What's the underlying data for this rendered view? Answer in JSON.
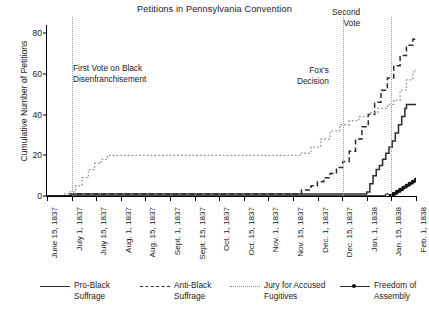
{
  "chart_data": {
    "type": "line",
    "title": "Petitions in Pennsylvania Convention",
    "xlabel": "",
    "ylabel": "Cumulative Number of Petitions",
    "ylim": [
      0,
      84
    ],
    "yticks": [
      0,
      20,
      40,
      60,
      80
    ],
    "grid": false,
    "legend_position": "bottom",
    "x_categories": [
      "June 15, 1837",
      "July 1, 1837",
      "July 15, 1837",
      "Aug. 1, 1837",
      "Aug. 15, 1837",
      "Sept. 1, 1837",
      "Sept. 15, 1837",
      "Oct. 1, 1837",
      "Oct. 15, 1837",
      "Nov. 1, 1837",
      "Nov. 15, 1837",
      "Dec. 1, 1837",
      "Dec. 15, 1837",
      "Jan. 1, 1838",
      "Jan. 15, 1838",
      "Feb. 1, 1838"
    ],
    "x_range_days": [
      0,
      232
    ],
    "annotations": [
      {
        "label": "First Vote on Black\nDisenfranchisement",
        "x_day": 16,
        "kind": "vertical-line"
      },
      {
        "label": "Fox's\nDecision",
        "x_day": 186,
        "kind": "vertical-line"
      },
      {
        "label": "Second\nVote",
        "x_day": 216,
        "kind": "vertical-line"
      }
    ],
    "series": [
      {
        "name": "Pro-Black Suffrage",
        "style": "solid",
        "color": "#2b2b2b",
        "final_value": 45,
        "points": [
          [
            0,
            0
          ],
          [
            14,
            0
          ],
          [
            16,
            1
          ],
          [
            40,
            1
          ],
          [
            180,
            1
          ],
          [
            196,
            1
          ],
          [
            200,
            1
          ],
          [
            201,
            2
          ],
          [
            203,
            6
          ],
          [
            205,
            10
          ],
          [
            207,
            13
          ],
          [
            209,
            15
          ],
          [
            211,
            18
          ],
          [
            213,
            21
          ],
          [
            215,
            24
          ],
          [
            217,
            27
          ],
          [
            219,
            31
          ],
          [
            221,
            35
          ],
          [
            223,
            39
          ],
          [
            225,
            43
          ],
          [
            226,
            45
          ],
          [
            232,
            45
          ]
        ]
      },
      {
        "name": "Anti-Black Suffrage",
        "style": "dashed",
        "color": "#2b2b2b",
        "final_value": 77,
        "points": [
          [
            0,
            0
          ],
          [
            14,
            1
          ],
          [
            16,
            1
          ],
          [
            150,
            1
          ],
          [
            160,
            3
          ],
          [
            166,
            5
          ],
          [
            170,
            7
          ],
          [
            174,
            9
          ],
          [
            178,
            11
          ],
          [
            182,
            14
          ],
          [
            186,
            17
          ],
          [
            190,
            22
          ],
          [
            194,
            28
          ],
          [
            198,
            34
          ],
          [
            202,
            40
          ],
          [
            206,
            46
          ],
          [
            210,
            52
          ],
          [
            214,
            58
          ],
          [
            218,
            64
          ],
          [
            222,
            69
          ],
          [
            226,
            74
          ],
          [
            230,
            77
          ],
          [
            232,
            77
          ]
        ]
      },
      {
        "name": "Jury for Accused Fugitives",
        "style": "dotted",
        "color": "#8c8c8c",
        "final_value": 62,
        "points": [
          [
            0,
            0
          ],
          [
            10,
            1
          ],
          [
            14,
            2
          ],
          [
            18,
            5
          ],
          [
            22,
            9
          ],
          [
            26,
            13
          ],
          [
            30,
            16
          ],
          [
            34,
            18
          ],
          [
            38,
            20
          ],
          [
            44,
            20
          ],
          [
            100,
            20
          ],
          [
            150,
            20
          ],
          [
            160,
            21
          ],
          [
            166,
            24
          ],
          [
            172,
            28
          ],
          [
            178,
            32
          ],
          [
            184,
            35
          ],
          [
            190,
            37
          ],
          [
            196,
            39
          ],
          [
            202,
            41
          ],
          [
            208,
            43
          ],
          [
            214,
            45
          ],
          [
            218,
            47
          ],
          [
            222,
            52
          ],
          [
            226,
            57
          ],
          [
            230,
            61
          ],
          [
            232,
            62
          ]
        ]
      },
      {
        "name": "Freedom of Assembly",
        "style": "solid-with-markers",
        "color": "#111111",
        "final_value": 8,
        "points": [
          [
            0,
            0
          ],
          [
            100,
            0
          ],
          [
            186,
            0
          ],
          [
            214,
            0
          ],
          [
            216,
            0
          ],
          [
            218,
            1
          ],
          [
            220,
            2
          ],
          [
            222,
            3
          ],
          [
            224,
            4
          ],
          [
            226,
            5
          ],
          [
            228,
            6
          ],
          [
            230,
            7
          ],
          [
            232,
            8
          ]
        ],
        "marker_points": [
          [
            216,
            0
          ],
          [
            218,
            1
          ],
          [
            220,
            2
          ],
          [
            222,
            3
          ],
          [
            224,
            4
          ],
          [
            226,
            5
          ],
          [
            228,
            6
          ],
          [
            230,
            7
          ],
          [
            232,
            8
          ]
        ]
      }
    ],
    "legend": [
      {
        "label": "Pro-Black\nSuffrage",
        "style": "solid"
      },
      {
        "label": "Anti-Black\nSuffrage",
        "style": "dashed"
      },
      {
        "label": "Jury for Accused\nFugitives",
        "style": "dotted"
      },
      {
        "label": "Freedom of\nAssembly",
        "style": "solid-with-markers"
      }
    ]
  },
  "colors": {
    "axis": "#000000",
    "solid_series": "#2b2b2b",
    "dotted_series": "#8c8c8c",
    "annotation_line": "#9a9a9a",
    "background": "#ffffff"
  }
}
